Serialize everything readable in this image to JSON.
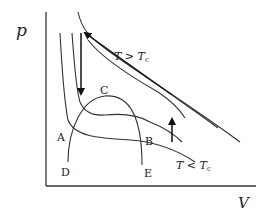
{
  "diagram": {
    "axes": {
      "y_label": "p",
      "x_label": "V"
    },
    "points": {
      "A": "A",
      "B": "B",
      "C": "C",
      "D": "D",
      "E": "E"
    },
    "annotations": {
      "above_critical": {
        "T": "T",
        "op": " > ",
        "Tc": "T",
        "sub": "c"
      },
      "below_critical": {
        "T": "T",
        "op": " < ",
        "Tc": "T",
        "sub": "c"
      }
    },
    "arrows": [
      {
        "name": "downward-arrow",
        "direction": "down"
      },
      {
        "name": "diagonal-arrow",
        "direction": "up-left"
      },
      {
        "name": "upward-arrow",
        "direction": "up"
      }
    ],
    "colors": {
      "line": "#333333",
      "background": "#ffffff"
    }
  }
}
